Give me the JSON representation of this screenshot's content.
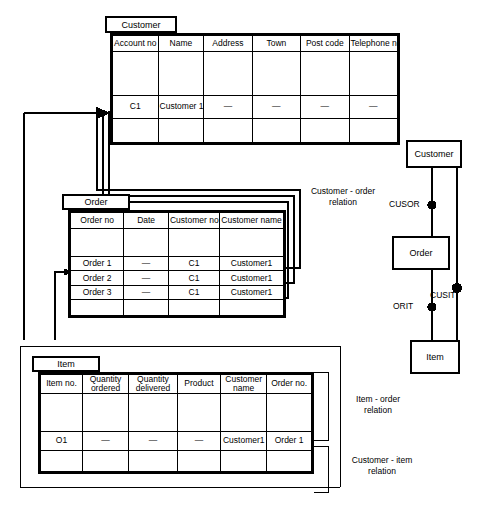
{
  "diagram": {
    "ink_color": "#000000",
    "background": "#ffffff"
  },
  "tables": {
    "customer": {
      "tab_label": "Customer",
      "columns": [
        "Account no",
        "Name",
        "Address",
        "Town",
        "Post code",
        "Telephone no."
      ],
      "rows": [
        {
          "kind": "blank",
          "cells": [
            "",
            "",
            "",
            "",
            "",
            ""
          ]
        },
        {
          "kind": "data",
          "cells": [
            "C1",
            "Customer 1",
            "—",
            "—",
            "—",
            "—"
          ]
        },
        {
          "kind": "tail",
          "cells": [
            "",
            "",
            "",
            "",
            "",
            ""
          ]
        }
      ]
    },
    "order": {
      "tab_label": "Order",
      "columns": [
        "Order no",
        "Date",
        "Customer no",
        "Customer name"
      ],
      "rows": [
        {
          "kind": "blank",
          "cells": [
            "",
            "",
            "",
            ""
          ]
        },
        {
          "kind": "data",
          "cells": [
            "Order 1",
            "—",
            "C1",
            "Customer1"
          ]
        },
        {
          "kind": "data",
          "cells": [
            "Order 2",
            "—",
            "C1",
            "Customer1"
          ]
        },
        {
          "kind": "data",
          "cells": [
            "Order 3",
            "—",
            "C1",
            "Customer1"
          ]
        },
        {
          "kind": "tail",
          "cells": [
            "",
            "",
            "",
            ""
          ]
        }
      ]
    },
    "item": {
      "tab_label": "Item",
      "columns": [
        "Item no.",
        "Quantity ordered",
        "Quantity delivered",
        "Product",
        "Customer name",
        "Order no."
      ],
      "rows": [
        {
          "kind": "blank",
          "cells": [
            "",
            "",
            "",
            "",
            "",
            ""
          ]
        },
        {
          "kind": "data",
          "cells": [
            "O1",
            "—",
            "—",
            "—",
            "Customer1",
            "Order 1"
          ]
        },
        {
          "kind": "tail",
          "cells": [
            "",
            "",
            "",
            "",
            "",
            ""
          ]
        }
      ]
    }
  },
  "annotations": {
    "customer_order_relation": "Customer - order\nrelation",
    "item_order_relation": "Item - order\nrelation",
    "customer_item_relation": "Customer - item\nrelation"
  },
  "er_diagram": {
    "entities": [
      {
        "id": "customer",
        "label": "Customer"
      },
      {
        "id": "order",
        "label": "Order"
      },
      {
        "id": "item",
        "label": "Item"
      }
    ],
    "relationships": [
      {
        "id": "cusor",
        "label": "CUSOR",
        "from": "customer",
        "to": "order"
      },
      {
        "id": "orit",
        "label": "ORIT",
        "from": "order",
        "to": "item"
      },
      {
        "id": "cusit",
        "label": "CUSIT",
        "from": "customer",
        "to": "item"
      }
    ]
  }
}
